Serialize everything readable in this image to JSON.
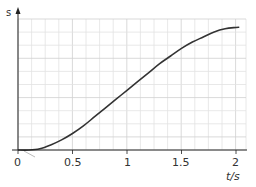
{
  "chart_data": {
    "type": "line",
    "title": "",
    "xlabel": "t / s",
    "ylabel": "s",
    "xlim": [
      0,
      2.1
    ],
    "ylim": [
      0,
      1
    ],
    "grid": true,
    "legend": null,
    "x_ticks": [
      {
        "value": 0,
        "label": "0"
      },
      {
        "value": 0.5,
        "label": "0.5"
      },
      {
        "value": 1,
        "label": "1"
      },
      {
        "value": 1.5,
        "label": "1.5"
      },
      {
        "value": 2,
        "label": "2"
      }
    ],
    "y_ticks": [],
    "series": [
      {
        "name": "displacement s",
        "color": "#333333",
        "x": [
          0,
          0.1,
          0.2,
          0.3,
          0.4,
          0.5,
          0.6,
          0.7,
          0.8,
          0.9,
          1.0,
          1.1,
          1.2,
          1.3,
          1.4,
          1.5,
          1.6,
          1.7,
          1.8,
          1.9,
          2.0,
          2.03
        ],
        "y": [
          0,
          0.0,
          0.01,
          0.04,
          0.08,
          0.13,
          0.19,
          0.26,
          0.33,
          0.4,
          0.47,
          0.54,
          0.61,
          0.68,
          0.74,
          0.8,
          0.85,
          0.89,
          0.93,
          0.955,
          0.965,
          0.967
        ]
      }
    ],
    "annotations": [
      {
        "type": "faint-tangent-stroke",
        "near": "origin",
        "color": "#bbbbbb"
      }
    ]
  },
  "labels": {
    "y_axis": "s",
    "x_axis": "t/s",
    "origin": "0",
    "tick_05": "0.5",
    "tick_1": "1",
    "tick_15": "1.5",
    "tick_2": "2"
  },
  "colors": {
    "grid_minor": "#e2e2e2",
    "grid_major": "#cfcfcf",
    "axis": "#222222",
    "curve": "#333333"
  }
}
